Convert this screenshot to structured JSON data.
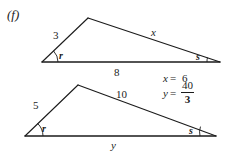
{
  "figure": {
    "part_label": "(f)",
    "background_color": "#ffffff",
    "stroke_color": "#1b1b1b",
    "triangles": [
      {
        "name": "upper-triangle",
        "vertices": {
          "left": [
            42,
            62
          ],
          "apex": [
            88,
            18
          ],
          "right": [
            220,
            62
          ]
        },
        "labels": {
          "left_side": "3",
          "right_side": "x",
          "base": "8",
          "angle_left": "r",
          "angle_right": "s"
        }
      },
      {
        "name": "lower-triangle",
        "vertices": {
          "left": [
            25,
            136
          ],
          "apex": [
            78,
            85
          ],
          "right": [
            216,
            136
          ]
        },
        "labels": {
          "left_side": "5",
          "right_side": "10",
          "base": "y",
          "angle_left": "r",
          "angle_right": "s"
        }
      }
    ]
  },
  "answers": [
    {
      "variable": "x",
      "equals": "=",
      "value": "6",
      "is_fraction": false
    },
    {
      "variable": "y",
      "equals": "=",
      "numerator": "40",
      "denominator": "3",
      "is_fraction": true
    }
  ]
}
